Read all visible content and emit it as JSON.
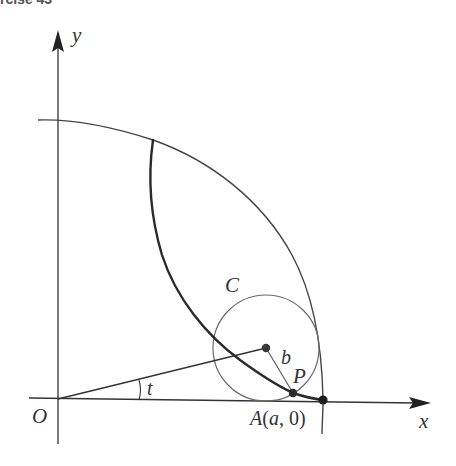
{
  "header": {
    "cropped_text": "rcise 43"
  },
  "diagram": {
    "labels": {
      "y_axis": "y",
      "x_axis": "x",
      "origin": "O",
      "circle": "C",
      "radius": "b",
      "point_p": "P",
      "point_a_letter": "A",
      "point_a_args": "(a, 0)",
      "angle": "t"
    },
    "colors": {
      "axes": "#333333",
      "outer_circle": "#444444",
      "rolling_circle": "#6a6a6a",
      "hypocycloid": "#2a2a2a",
      "points": "#2a2a2a",
      "text": "#333333"
    },
    "geometry": {
      "origin_px": [
        57,
        400
      ],
      "point_A_px": [
        323,
        400
      ],
      "rolling_center_px": [
        266,
        348
      ],
      "rolling_radius_px": 53,
      "point_P_px": [
        293,
        393
      ],
      "cusp_top_px": [
        153,
        140
      ]
    }
  }
}
